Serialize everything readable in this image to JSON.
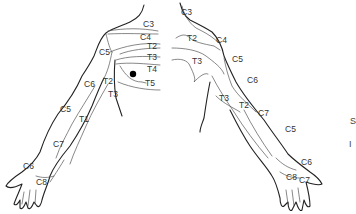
{
  "diagram": {
    "colors": {
      "line": "#222222",
      "boundary": "#555555",
      "text": "#333333",
      "marker": "#000000",
      "background": "#ffffff"
    },
    "left_side_labels": {
      "c3": "C3",
      "c4": "C4",
      "t2_chest": "T2",
      "t3_chest": "T3",
      "t4": "T4",
      "t5": "T5",
      "c5_shoulder": "C5",
      "c6_upper": "C6",
      "t2_axilla": "T2",
      "t3_axilla": "T3",
      "c5_forearm": "C5",
      "t1": "T1",
      "c7": "C7",
      "c6_hand": "C6",
      "c8": "C8"
    },
    "right_side_labels": {
      "c3": "C3",
      "t2_chest": "T2",
      "c4": "C4",
      "t3_chest": "T3",
      "c5_shoulder": "C5",
      "c6_upper": "C6",
      "t3_axilla": "T3",
      "t2_axilla": "T2",
      "c7_forearm": "C7",
      "c5_forearm": "C5",
      "c6_hand": "C6",
      "c8": "C8",
      "c7_hand": "C7"
    },
    "marker": {
      "label": "nipple-marker"
    },
    "edge_text": {
      "line1": "S",
      "line2": "I"
    }
  }
}
